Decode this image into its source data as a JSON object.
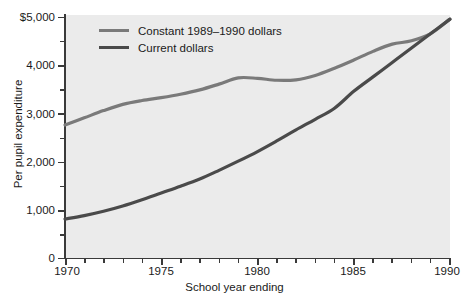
{
  "chart_data": {
    "type": "line",
    "title": "",
    "subtitle": "",
    "xlabel": "School year ending",
    "ylabel": "Per pupil expenditure",
    "xlim": [
      1970,
      1990
    ],
    "ylim": [
      0,
      5000
    ],
    "grid": false,
    "legend_position": "top-left-inside",
    "x_ticks_major": [
      1970,
      1975,
      1980,
      1985,
      1990
    ],
    "x_tick_labels": [
      "1970",
      "1975",
      "1980",
      "1985",
      "1990"
    ],
    "x_ticks_minor": [
      1971,
      1972,
      1973,
      1974,
      1976,
      1977,
      1978,
      1979,
      1981,
      1982,
      1983,
      1984,
      1986,
      1987,
      1988,
      1989
    ],
    "y_ticks_major": [
      0,
      1000,
      2000,
      3000,
      4000,
      5000
    ],
    "y_tick_labels": [
      "0",
      "1,000",
      "2,000",
      "3,000",
      "4,000",
      "$5,000"
    ],
    "y_ticks_minor": [
      500,
      1500,
      2500,
      3500,
      4500
    ],
    "x": [
      1970,
      1971,
      1972,
      1973,
      1974,
      1975,
      1976,
      1977,
      1978,
      1979,
      1980,
      1981,
      1982,
      1983,
      1984,
      1985,
      1986,
      1987,
      1988,
      1989,
      1990
    ],
    "series": [
      {
        "name": "Constant 1989-1990 dollars",
        "color": "#7a7a7a",
        "values": [
          2750,
          2900,
          3050,
          3180,
          3260,
          3320,
          3390,
          3480,
          3600,
          3730,
          3720,
          3680,
          3690,
          3780,
          3930,
          4100,
          4280,
          4430,
          4500,
          4650,
          4950
        ]
      },
      {
        "name": "Current dollars",
        "color": "#4a4a4a",
        "values": [
          800,
          870,
          960,
          1070,
          1200,
          1340,
          1480,
          1630,
          1810,
          2000,
          2200,
          2420,
          2650,
          2870,
          3100,
          3450,
          3750,
          4050,
          4350,
          4650,
          4950
        ]
      }
    ]
  },
  "legend": {
    "items": [
      {
        "label": "Constant 1989–1990 dollars",
        "color": "#7a7a7a"
      },
      {
        "label": "Current dollars",
        "color": "#4a4a4a"
      }
    ]
  },
  "axes": {
    "x_title": "School year ending",
    "y_title": "Per pupil expenditure",
    "y_labels": {
      "t0": "0",
      "t1000": "1,000",
      "t2000": "2,000",
      "t3000": "3,000",
      "t4000": "4,000",
      "t5000": "$5,000"
    },
    "x_labels": {
      "t1970": "1970",
      "t1975": "1975",
      "t1980": "1980",
      "t1985": "1985",
      "t1990": "1990"
    }
  },
  "colors": {
    "panel_background": "#ebebeb",
    "figure_background": "#ffffff",
    "axis": "#3a3a3a",
    "text": "#1a1a1a",
    "series_constant": "#7a7a7a",
    "series_current": "#4a4a4a"
  }
}
